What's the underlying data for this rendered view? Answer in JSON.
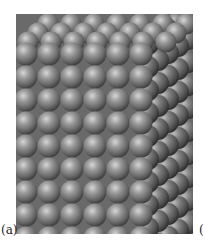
{
  "figure": {
    "sphere_color": "#8c8c8c",
    "sphere_highlight": "#d8d8d8",
    "sphere_shadow": "#3a3a3a",
    "background_color": "#6e6e6e",
    "front_face": {
      "columns": 6,
      "rows": 8,
      "diameter": 23
    },
    "top_face": {
      "rows": 3
    },
    "side_face": {
      "columns": 5,
      "rows": 10
    }
  },
  "labels": {
    "panel_a": "(a)",
    "panel_b": "("
  }
}
